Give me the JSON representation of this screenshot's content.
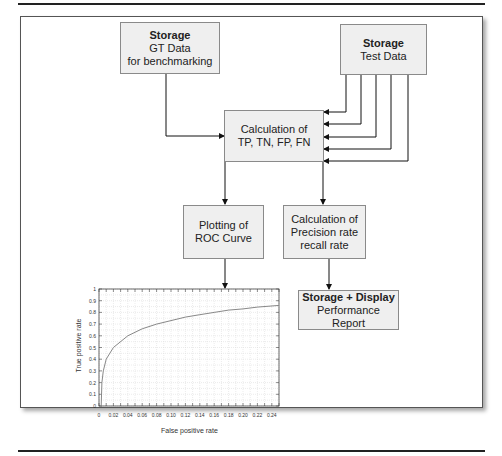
{
  "diagram": {
    "nodes": {
      "gt_storage": {
        "title": "Storage",
        "line1": "GT Data",
        "line2": "for benchmarking"
      },
      "test_storage": {
        "title": "Storage",
        "line1": "Test Data"
      },
      "calc_conf": {
        "line1": "Calculation of",
        "line2": "TP, TN, FP, FN"
      },
      "roc_plot": {
        "line1": "Plotting of",
        "line2": "ROC Curve"
      },
      "prec_recall": {
        "line1": "Calculation of",
        "line2": "Precision rate",
        "line3": "recall rate"
      },
      "perf_report": {
        "title": "Storage + Display",
        "line1": "Performance Report"
      }
    },
    "edges": [
      {
        "from": "gt_storage",
        "to": "calc_conf"
      },
      {
        "from": "test_storage",
        "to": "calc_conf",
        "count": 5
      },
      {
        "from": "calc_conf",
        "to": "roc_plot"
      },
      {
        "from": "calc_conf",
        "to": "prec_recall"
      },
      {
        "from": "roc_plot",
        "to": "roc_chart"
      },
      {
        "from": "prec_recall",
        "to": "perf_report"
      }
    ]
  },
  "chart_data": {
    "type": "line",
    "title": "",
    "xlabel": "False positive rate",
    "ylabel": "True positive rate",
    "xlim": [
      0,
      0.25
    ],
    "ylim": [
      0,
      1
    ],
    "grid": true,
    "x_ticks": [
      "0",
      "0.02",
      "0.04",
      "0.06",
      "0.08",
      "0.10",
      "0.12",
      "0.14",
      "0.16",
      "0.18",
      "0.20",
      "0.22",
      "0.24"
    ],
    "y_ticks": [
      "0",
      "0.1",
      "0.2",
      "0.3",
      "0.4",
      "0.5",
      "0.6",
      "0.7",
      "0.8",
      "0.9",
      "1"
    ],
    "series": [
      {
        "name": "ROC",
        "x": [
          0.003,
          0.004,
          0.006,
          0.01,
          0.02,
          0.04,
          0.06,
          0.08,
          0.1,
          0.12,
          0.14,
          0.16,
          0.18,
          0.2,
          0.22,
          0.25
        ],
        "y": [
          0.0,
          0.2,
          0.3,
          0.4,
          0.5,
          0.6,
          0.66,
          0.7,
          0.73,
          0.76,
          0.78,
          0.8,
          0.82,
          0.83,
          0.845,
          0.86
        ]
      }
    ]
  }
}
